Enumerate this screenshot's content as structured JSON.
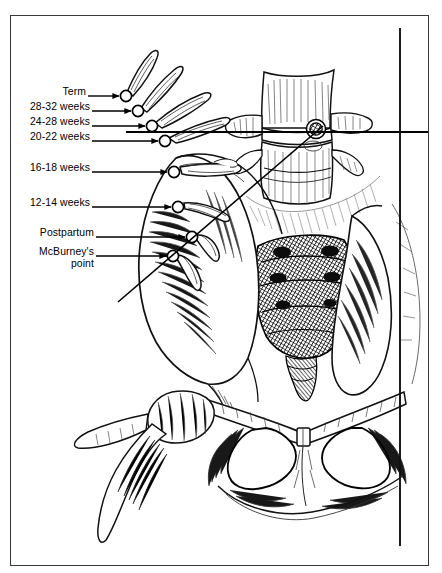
{
  "figure": {
    "kind": "medical-line-illustration",
    "background_color": "#ffffff",
    "ink_color": "#000000",
    "frame_color": "#3a3a3a"
  },
  "labels": [
    {
      "id": "term",
      "text": "Term",
      "x": 62,
      "y": 92,
      "arrow_to_x": 122,
      "arrow_to_y": 96,
      "marker_x": 125,
      "marker_y": 96
    },
    {
      "id": "w28_32",
      "text": "28-32 weeks",
      "x": 27,
      "y": 107,
      "arrow_to_x": 133,
      "arrow_to_y": 111,
      "marker_x": 137,
      "marker_y": 111
    },
    {
      "id": "w24_28",
      "text": "24-28 weeks",
      "x": 27,
      "y": 122,
      "arrow_to_x": 147,
      "arrow_to_y": 126,
      "marker_x": 151,
      "marker_y": 126
    },
    {
      "id": "w20_22",
      "text": "20-22 weeks",
      "x": 27,
      "y": 137,
      "arrow_to_x": 160,
      "arrow_to_y": 141,
      "marker_x": 164,
      "marker_y": 141
    },
    {
      "id": "w16_18",
      "text": "16-18 weeks",
      "x": 27,
      "y": 168,
      "arrow_to_x": 168,
      "arrow_to_y": 172,
      "marker_x": 173,
      "marker_y": 172
    },
    {
      "id": "w12_14",
      "text": "12-14 weeks",
      "x": 27,
      "y": 203,
      "arrow_to_x": 172,
      "arrow_to_y": 207,
      "marker_x": 177,
      "marker_y": 207
    },
    {
      "id": "postpartum",
      "text": "Postpartum",
      "x": 33,
      "y": 233,
      "arrow_to_x": 186,
      "arrow_to_y": 237,
      "marker_x": 191,
      "marker_y": 237
    },
    {
      "id": "mcburney",
      "text": "McBurney's",
      "x": 33,
      "y": 252,
      "arrow_to_x": 167,
      "arrow_to_y": 256,
      "marker_x": 172,
      "marker_y": 256
    },
    {
      "id": "mcburney2",
      "text": "point",
      "x": 63,
      "y": 264,
      "arrow_to_x": null,
      "arrow_to_y": null,
      "marker_x": null,
      "marker_y": null
    }
  ],
  "reference_lines": {
    "horizontal": {
      "name": "umbilical-reference-line",
      "x1": 126,
      "y1": 132,
      "x2": 438,
      "y2": 132
    },
    "diagonal": {
      "name": "mcburney-line",
      "x1": 118,
      "y1": 302,
      "x2": 322,
      "y2": 126
    },
    "vertical": {
      "name": "midline-reference-line",
      "x1": 400,
      "y1": 28,
      "x2": 400,
      "y2": 546
    }
  },
  "anatomy": [
    {
      "id": "lumbar-vertebra-upper",
      "label": "Lumbar vertebral body"
    },
    {
      "id": "lumbar-vertebra-lower",
      "label": "Lumbar vertebral body"
    },
    {
      "id": "transverse-process-left",
      "label": "Transverse process"
    },
    {
      "id": "transverse-process-right",
      "label": "Transverse process"
    },
    {
      "id": "sacrum",
      "label": "Sacrum"
    },
    {
      "id": "sacral-foramina",
      "label": "Sacral foramina"
    },
    {
      "id": "coccyx",
      "label": "Coccyx"
    },
    {
      "id": "ilium-left",
      "label": "Iliac wing"
    },
    {
      "id": "iliac-crest",
      "label": "Iliac crest"
    },
    {
      "id": "obturator-foramen-left",
      "label": "Obturator foramen"
    },
    {
      "id": "obturator-foramen-right",
      "label": "Obturator foramen"
    },
    {
      "id": "pubic-symphysis",
      "label": "Pubic symphysis"
    },
    {
      "id": "femur-head-left",
      "label": "Femoral head"
    }
  ],
  "fundus_markers": {
    "name": "uterine-fundus-and-adnexa-series",
    "count": 8,
    "description": "Open circles with tapered adnexal/tubal forms marking successive fundal heights"
  }
}
